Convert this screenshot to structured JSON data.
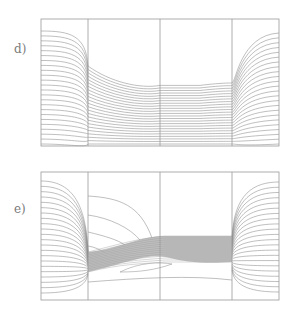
{
  "figure": {
    "panels": [
      {
        "id": "d",
        "label": "d)",
        "label_pos": [
          14,
          50
        ],
        "frame": {
          "x": 41,
          "y": 19,
          "w": 238,
          "h": 127
        },
        "dividers_x": [
          88,
          160,
          232
        ],
        "description": "Field lines in three-region geometry; upper middle regions empty, lines compressed below a boundary stepping down from left divider to middle divider then flat",
        "style": {
          "line_color": "#8a8a8a",
          "frame_color": "#9a9a9a"
        }
      },
      {
        "id": "e",
        "label": "e)",
        "label_pos": [
          14,
          210
        ],
        "frame": {
          "x": 41,
          "y": 172,
          "w": 238,
          "h": 128
        },
        "dividers_x": [
          88,
          160,
          232
        ],
        "description": "Field lines fanning from focal points at the left and right dividers; dense shaded band crossing middle region rising from left to right",
        "style": {
          "line_color": "#8a8a8a",
          "frame_color": "#9a9a9a",
          "band_color": "#b4b4b4"
        }
      }
    ]
  }
}
